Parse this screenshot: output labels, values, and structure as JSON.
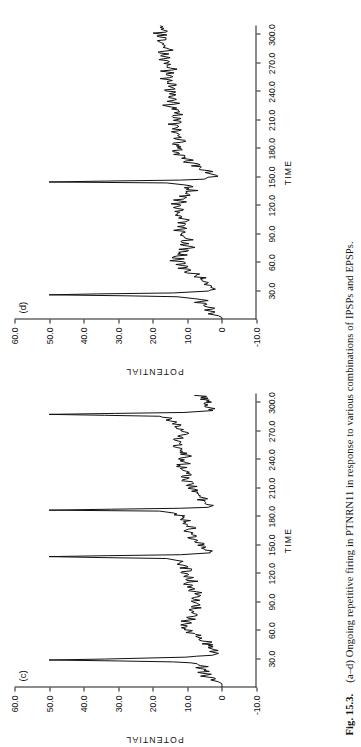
{
  "caption": {
    "number": "Fig. 15.3.",
    "text": "(a–d) Ongoing repetitive firing in PTNRN11 in response to various combinations of IPSPs and EPSPs."
  },
  "panels": [
    {
      "id": "c",
      "label": "(c)",
      "chart_data": {
        "type": "line",
        "title": "(c)",
        "xlabel": "TIME",
        "ylabel": "POTENTIAL",
        "xlim": [
          0,
          310
        ],
        "ylim": [
          -10,
          60
        ],
        "xticks": [
          "30.0",
          "60.0",
          "90.0",
          "120.0",
          "150.0",
          "180.0",
          "210.0",
          "240.0",
          "270.0",
          "300.0"
        ],
        "xtick_values": [
          30,
          60,
          90,
          120,
          150,
          180,
          210,
          240,
          270,
          300
        ],
        "yticks": [
          "60.0",
          "50.0",
          "40.0",
          "30.0",
          "20.0",
          "10.0",
          "0",
          "-10.0"
        ],
        "ytick_values": [
          60,
          50,
          40,
          30,
          20,
          10,
          0,
          -10
        ],
        "grid": false,
        "legend": false,
        "spike_times": [
          28,
          137,
          187,
          288
        ],
        "spike_peak": 50,
        "baseline": 6,
        "series": [
          {
            "name": "membrane potential",
            "x": [
              0,
              2,
              4,
              6,
              8,
              10,
              12,
              14,
              16,
              18,
              20,
              22,
              24,
              26,
              27,
              28,
              29,
              30,
              32,
              34,
              36,
              38,
              40,
              42,
              44,
              46,
              48,
              50,
              52,
              54,
              56,
              58,
              60,
              62,
              64,
              66,
              68,
              70,
              72,
              74,
              76,
              78,
              80,
              82,
              84,
              86,
              88,
              90,
              92,
              94,
              96,
              98,
              100,
              102,
              104,
              106,
              108,
              110,
              112,
              114,
              116,
              118,
              120,
              122,
              124,
              126,
              128,
              130,
              132,
              134,
              136,
              137,
              138,
              139,
              140,
              142,
              144,
              146,
              148,
              150,
              152,
              154,
              156,
              158,
              160,
              162,
              164,
              166,
              168,
              170,
              172,
              174,
              176,
              178,
              180,
              182,
              184,
              186,
              187,
              188,
              189,
              190,
              192,
              194,
              196,
              198,
              200,
              202,
              204,
              206,
              208,
              210,
              212,
              214,
              216,
              218,
              220,
              222,
              224,
              226,
              228,
              230,
              232,
              234,
              236,
              238,
              240,
              242,
              244,
              246,
              248,
              250,
              252,
              254,
              256,
              258,
              260,
              262,
              264,
              266,
              268,
              270,
              272,
              274,
              276,
              278,
              280,
              282,
              284,
              286,
              287,
              288,
              289,
              290,
              292,
              294,
              296,
              298,
              300,
              302,
              304,
              306,
              308,
              310
            ],
            "y": [
              0,
              0,
              0,
              1,
              3,
              2,
              5,
              3,
              6,
              4,
              7,
              5,
              8,
              9,
              14,
              30,
              50,
              34,
              10,
              2,
              1,
              3,
              2,
              4,
              3,
              5,
              4,
              6,
              5,
              7,
              8,
              10,
              9,
              11,
              10,
              12,
              9,
              11,
              8,
              10,
              7,
              9,
              8,
              10,
              7,
              9,
              6,
              8,
              7,
              9,
              6,
              8,
              7,
              9,
              8,
              10,
              9,
              11,
              8,
              10,
              9,
              11,
              10,
              12,
              9,
              11,
              10,
              12,
              11,
              13,
              16,
              35,
              50,
              33,
              12,
              4,
              3,
              5,
              4,
              6,
              5,
              8,
              7,
              9,
              8,
              10,
              9,
              11,
              8,
              10,
              9,
              11,
              10,
              12,
              11,
              13,
              14,
              18,
              50,
              32,
              12,
              4,
              3,
              5,
              4,
              6,
              5,
              7,
              6,
              8,
              7,
              9,
              8,
              10,
              9,
              11,
              10,
              12,
              9,
              11,
              10,
              12,
              11,
              13,
              10,
              12,
              11,
              13,
              10,
              12,
              11,
              13,
              12,
              14,
              11,
              13,
              12,
              14,
              11,
              13,
              10,
              12,
              11,
              13,
              12,
              14,
              13,
              15,
              14,
              18,
              34,
              50,
              31,
              11,
              3,
              2,
              4,
              3,
              5,
              4,
              6,
              5,
              7
            ]
          }
        ]
      }
    },
    {
      "id": "d",
      "label": "(d)",
      "chart_data": {
        "type": "line",
        "title": "(d)",
        "xlabel": "TIME",
        "ylabel": "POTENTIAL",
        "xlim": [
          0,
          310
        ],
        "ylim": [
          -10,
          60
        ],
        "xticks": [
          "30.0",
          "60.0",
          "90.0",
          "120.0",
          "150.0",
          "180.0",
          "210.0",
          "240.0",
          "270.0",
          "300.0"
        ],
        "xtick_values": [
          30,
          60,
          90,
          120,
          150,
          180,
          210,
          240,
          270,
          300
        ],
        "yticks": [
          "60.0",
          "50.0",
          "40.0",
          "30.0",
          "20.0",
          "10.0",
          "0",
          "-10.0"
        ],
        "ytick_values": [
          60,
          50,
          40,
          30,
          20,
          10,
          0,
          -10
        ],
        "grid": false,
        "legend": false,
        "spike_times": [
          25,
          145
        ],
        "spike_peak": 50,
        "baseline": 6,
        "series": [
          {
            "name": "membrane potential",
            "x": [
              0,
              2,
              4,
              6,
              8,
              10,
              12,
              14,
              16,
              18,
              20,
              22,
              24,
              25,
              26,
              27,
              28,
              30,
              32,
              34,
              36,
              38,
              40,
              42,
              44,
              46,
              48,
              50,
              52,
              54,
              56,
              58,
              60,
              62,
              64,
              66,
              68,
              70,
              72,
              74,
              76,
              78,
              80,
              82,
              84,
              86,
              88,
              90,
              92,
              94,
              96,
              98,
              100,
              102,
              104,
              106,
              108,
              110,
              112,
              114,
              116,
              118,
              120,
              122,
              124,
              126,
              128,
              130,
              132,
              134,
              136,
              138,
              140,
              142,
              144,
              145,
              146,
              147,
              148,
              150,
              152,
              154,
              156,
              158,
              160,
              162,
              164,
              166,
              168,
              170,
              172,
              174,
              176,
              178,
              180,
              182,
              184,
              186,
              188,
              190,
              192,
              194,
              196,
              198,
              200,
              202,
              204,
              206,
              208,
              210,
              212,
              214,
              216,
              218,
              220,
              222,
              224,
              226,
              228,
              230,
              232,
              234,
              236,
              238,
              240,
              242,
              244,
              246,
              248,
              250,
              252,
              254,
              256,
              258,
              260,
              262,
              264,
              266,
              268,
              270,
              272,
              274,
              276,
              278,
              280,
              282,
              284,
              286,
              288,
              290,
              292,
              294,
              296,
              298,
              300,
              302,
              304,
              306,
              308,
              310
            ],
            "y": [
              0,
              0,
              1,
              3,
              2,
              5,
              3,
              6,
              4,
              7,
              5,
              8,
              13,
              28,
              50,
              36,
              14,
              4,
              2,
              4,
              3,
              5,
              4,
              6,
              5,
              8,
              7,
              10,
              9,
              12,
              10,
              13,
              11,
              14,
              12,
              14,
              11,
              13,
              10,
              12,
              9,
              11,
              10,
              12,
              9,
              11,
              10,
              12,
              11,
              13,
              10,
              12,
              11,
              13,
              10,
              12,
              11,
              13,
              12,
              14,
              11,
              13,
              12,
              14,
              11,
              13,
              10,
              12,
              9,
              11,
              8,
              10,
              9,
              11,
              16,
              50,
              33,
              12,
              5,
              3,
              2,
              4,
              3,
              6,
              5,
              8,
              7,
              10,
              9,
              12,
              11,
              13,
              12,
              14,
              11,
              13,
              12,
              14,
              11,
              13,
              12,
              14,
              13,
              15,
              12,
              14,
              13,
              15,
              12,
              14,
              13,
              15,
              12,
              14,
              13,
              15,
              14,
              16,
              13,
              15,
              14,
              16,
              13,
              15,
              14,
              16,
              13,
              15,
              14,
              16,
              15,
              17,
              14,
              16,
              15,
              17,
              14,
              16,
              15,
              17,
              16,
              18,
              15,
              17,
              16,
              18,
              15,
              17,
              16,
              18,
              17,
              19,
              16,
              18,
              17,
              19,
              16,
              18,
              17,
              19
            ]
          }
        ]
      }
    }
  ]
}
